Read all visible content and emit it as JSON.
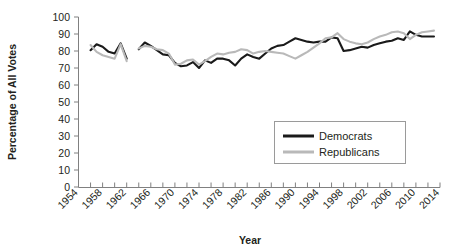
{
  "chart_data": {
    "type": "line",
    "title": "",
    "xlabel": "Year",
    "ylabel": "Percentage of All Votes",
    "ylim": [
      0,
      100
    ],
    "xlim": [
      1954,
      2014
    ],
    "ytick_step": 10,
    "xtick_step": 2,
    "xlabel_step": 4,
    "grid": false,
    "legend_position": "inside-right-middle",
    "yticks": [
      "0",
      "10",
      "20",
      "30",
      "40",
      "50",
      "60",
      "70",
      "80",
      "90",
      "100"
    ],
    "xticks": [
      "1954",
      "1958",
      "1962",
      "1966",
      "1970",
      "1974",
      "1978",
      "1982",
      "1986",
      "1990",
      "1994",
      "1998",
      "2002",
      "2006",
      "2010",
      "2014"
    ],
    "colors": {
      "democrats": "#1a1a1a",
      "republicans": "#b9b9b9",
      "axis": "#808080",
      "text": "#231f20",
      "background": "#ffffff"
    },
    "series": [
      {
        "name": "Democrats",
        "color": "#1a1a1a",
        "segments": [
          {
            "x": [
              1956,
              1957,
              1958,
              1959,
              1960,
              1961,
              1962
            ],
            "values": [
              80.5,
              84.0,
              82.5,
              79.5,
              78.5,
              84.5,
              75.5
            ]
          },
          {
            "x": [
              1964,
              1965,
              1966,
              1967,
              1968,
              1969,
              1970,
              1971,
              1972,
              1973,
              1974,
              1975,
              1976,
              1977,
              1978,
              1979,
              1980,
              1981,
              1982,
              1983,
              1984,
              1985,
              1986,
              1987,
              1988,
              1989,
              1990,
              1991,
              1992,
              1993,
              1994,
              1995,
              1996,
              1997,
              1998,
              1999,
              2000,
              2001,
              2002,
              2003,
              2004,
              2005,
              2006,
              2007,
              2008,
              2009,
              2010,
              2011,
              2012,
              2013
            ],
            "values": [
              81.0,
              85.0,
              83.0,
              80.5,
              78.0,
              77.5,
              73.0,
              71.0,
              71.5,
              73.5,
              70.0,
              74.5,
              73.0,
              75.5,
              75.5,
              74.5,
              71.5,
              75.5,
              78.0,
              76.5,
              75.5,
              78.5,
              81.5,
              83.0,
              83.5,
              85.5,
              87.5,
              86.5,
              85.5,
              85.0,
              85.5,
              85.5,
              88.0,
              87.5,
              80.0,
              80.5,
              81.5,
              82.5,
              82.0,
              83.5,
              84.5,
              85.5,
              86.0,
              87.5,
              86.5,
              91.5,
              89.5,
              88.5,
              88.5,
              88.5
            ]
          }
        ]
      },
      {
        "name": "Republicans",
        "color": "#b9b9b9",
        "segments": [
          {
            "x": [
              1956,
              1957,
              1958,
              1959,
              1960,
              1961,
              1962
            ],
            "values": [
              83.5,
              79.5,
              77.5,
              76.5,
              75.5,
              84.0,
              74.0
            ]
          },
          {
            "x": [
              1964,
              1965,
              1966,
              1967,
              1968,
              1969,
              1970,
              1971,
              1972,
              1973,
              1974,
              1975,
              1976,
              1977,
              1978,
              1979,
              1980,
              1981,
              1982,
              1983,
              1984,
              1985,
              1986,
              1987,
              1988,
              1989,
              1990,
              1991,
              1992,
              1993,
              1994,
              1995,
              1996,
              1997,
              1998,
              1999,
              2000,
              2001,
              2002,
              2003,
              2004,
              2005,
              2006,
              2007,
              2008,
              2009,
              2010,
              2011,
              2012,
              2013
            ],
            "values": [
              81.5,
              83.0,
              82.5,
              81.0,
              80.5,
              78.5,
              72.0,
              72.5,
              74.5,
              75.0,
              72.0,
              74.0,
              76.5,
              78.5,
              78.0,
              79.0,
              79.5,
              81.0,
              80.5,
              78.5,
              79.5,
              80.0,
              79.5,
              79.0,
              78.5,
              77.0,
              75.5,
              77.5,
              79.5,
              82.0,
              84.5,
              87.5,
              88.0,
              90.5,
              87.0,
              85.5,
              84.5,
              84.0,
              85.0,
              87.0,
              88.5,
              89.5,
              91.0,
              91.5,
              90.5,
              87.0,
              89.5,
              91.0,
              91.5,
              92.0
            ]
          }
        ]
      }
    ]
  },
  "legend": {
    "items": [
      {
        "label": "Democrats"
      },
      {
        "label": "Republicans"
      }
    ]
  },
  "axes": {
    "y_title": "Percentage of All Votes",
    "x_title": "Year"
  }
}
